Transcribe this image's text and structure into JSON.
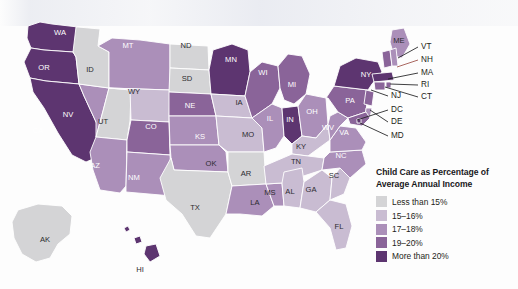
{
  "figure": {
    "width": 518,
    "height": 289,
    "background_color": "#fdfdfd"
  },
  "legend": {
    "title_line1": "Child Care as Percentage of",
    "title_line2": "Average Annual Income",
    "items": [
      {
        "label": "Less than 15%",
        "color": "#d4d4d6",
        "class_index": 0
      },
      {
        "label": "15–16%",
        "color": "#c9bcd2",
        "class_index": 1
      },
      {
        "label": "17–18%",
        "color": "#ab8fb9",
        "class_index": 2
      },
      {
        "label": "19–20%",
        "color": "#8a6499",
        "class_index": 3
      },
      {
        "label": "More than 20%",
        "color": "#5d3570",
        "class_index": 4
      }
    ]
  },
  "chart_data": {
    "type": "choropleth",
    "title": "Child Care as Percentage of Average Annual Income",
    "region": "United States",
    "classes": [
      "Less than 15%",
      "15–16%",
      "17–18%",
      "19–20%",
      "More than 20%"
    ],
    "class_colors": [
      "#d4d4d6",
      "#c9bcd2",
      "#ab8fb9",
      "#8a6499",
      "#5d3570"
    ],
    "legend_position": "bottom-right",
    "values": {
      "WA": 4,
      "OR": 4,
      "CA": 4,
      "NV": 2,
      "ID": 0,
      "UT": 0,
      "AZ": 2,
      "MT": 2,
      "WY": 1,
      "CO": 3,
      "NM": 2,
      "ND": 0,
      "SD": 0,
      "NE": 3,
      "KS": 2,
      "OK": 2,
      "TX": 0,
      "MN": 4,
      "IA": 1,
      "MO": 1,
      "AR": 0,
      "LA": 2,
      "WI": 3,
      "IL": 2,
      "MS": 2,
      "MI": 3,
      "IN": 4,
      "OH": 2,
      "KY": 1,
      "TN": 1,
      "AL": 1,
      "GA": 1,
      "FL": 1,
      "SC": 1,
      "NC": 2,
      "VA": 2,
      "WV": 2,
      "PA": 3,
      "NY": 4,
      "ME": 2,
      "VT": 3,
      "NH": 2,
      "MA": 4,
      "RI": 3,
      "CT": 3,
      "NJ": 3,
      "DE": 2,
      "MD": 3,
      "DC": 4,
      "AK": 0,
      "HI": 4
    },
    "state_labels": [
      {
        "code": "WA",
        "x": 60,
        "y": 33,
        "tone": "light"
      },
      {
        "code": "OR",
        "x": 44,
        "y": 68,
        "tone": "light"
      },
      {
        "code": "CA",
        "x": 38,
        "y": 131,
        "tone": "light"
      },
      {
        "code": "NV",
        "x": 68,
        "y": 115,
        "tone": "light"
      },
      {
        "code": "ID",
        "x": 90,
        "y": 70,
        "tone": "dark"
      },
      {
        "code": "UT",
        "x": 103,
        "y": 122,
        "tone": "dark"
      },
      {
        "code": "AZ",
        "x": 95,
        "y": 166,
        "tone": "light"
      },
      {
        "code": "MT",
        "x": 128,
        "y": 46,
        "tone": "light"
      },
      {
        "code": "WY",
        "x": 134,
        "y": 92,
        "tone": "dark"
      },
      {
        "code": "CO",
        "x": 151,
        "y": 127,
        "tone": "light"
      },
      {
        "code": "NM",
        "x": 134,
        "y": 178,
        "tone": "light"
      },
      {
        "code": "ND",
        "x": 186,
        "y": 46,
        "tone": "dark"
      },
      {
        "code": "SD",
        "x": 187,
        "y": 79,
        "tone": "dark"
      },
      {
        "code": "NE",
        "x": 190,
        "y": 106,
        "tone": "light"
      },
      {
        "code": "KS",
        "x": 200,
        "y": 137,
        "tone": "light"
      },
      {
        "code": "OK",
        "x": 211,
        "y": 164,
        "tone": "dark"
      },
      {
        "code": "TX",
        "x": 195,
        "y": 208,
        "tone": "dark"
      },
      {
        "code": "MN",
        "x": 231,
        "y": 60,
        "tone": "light"
      },
      {
        "code": "IA",
        "x": 239,
        "y": 103,
        "tone": "dark"
      },
      {
        "code": "MO",
        "x": 248,
        "y": 135,
        "tone": "dark"
      },
      {
        "code": "AR",
        "x": 246,
        "y": 174,
        "tone": "dark"
      },
      {
        "code": "LA",
        "x": 255,
        "y": 203,
        "tone": "dark"
      },
      {
        "code": "WI",
        "x": 263,
        "y": 73,
        "tone": "light"
      },
      {
        "code": "IL",
        "x": 270,
        "y": 119,
        "tone": "light"
      },
      {
        "code": "MS",
        "x": 270,
        "y": 193,
        "tone": "dark"
      },
      {
        "code": "MI",
        "x": 292,
        "y": 85,
        "tone": "light"
      },
      {
        "code": "IN",
        "x": 290,
        "y": 120,
        "tone": "light"
      },
      {
        "code": "OH",
        "x": 312,
        "y": 112,
        "tone": "light"
      },
      {
        "code": "KY",
        "x": 301,
        "y": 147,
        "tone": "dark"
      },
      {
        "code": "TN",
        "x": 296,
        "y": 162,
        "tone": "dark"
      },
      {
        "code": "AL",
        "x": 290,
        "y": 192,
        "tone": "dark"
      },
      {
        "code": "GA",
        "x": 311,
        "y": 190,
        "tone": "dark"
      },
      {
        "code": "FL",
        "x": 339,
        "y": 227,
        "tone": "dark"
      },
      {
        "code": "SC",
        "x": 334,
        "y": 176,
        "tone": "dark"
      },
      {
        "code": "NC",
        "x": 341,
        "y": 156,
        "tone": "light"
      },
      {
        "code": "VA",
        "x": 344,
        "y": 133,
        "tone": "light"
      },
      {
        "code": "WV",
        "x": 328,
        "y": 128,
        "tone": "light"
      },
      {
        "code": "PA",
        "x": 350,
        "y": 101,
        "tone": "light"
      },
      {
        "code": "NY",
        "x": 366,
        "y": 75,
        "tone": "light"
      },
      {
        "code": "ME",
        "x": 399,
        "y": 41,
        "tone": "dark"
      },
      {
        "code": "AK",
        "x": 45,
        "y": 240,
        "tone": "dark"
      },
      {
        "code": "HI",
        "x": 140,
        "y": 270,
        "tone": "dark"
      }
    ],
    "callouts": [
      {
        "code": "VT",
        "label_x": 421,
        "label_y": 47,
        "line": "M418,47 L398,58",
        "accent": false
      },
      {
        "code": "NH",
        "label_x": 421,
        "label_y": 60,
        "line": "M418,60 L397,67",
        "accent": true
      },
      {
        "code": "MA",
        "label_x": 421,
        "label_y": 73,
        "line": "M418,73 L388,79",
        "accent": false
      },
      {
        "code": "RI",
        "label_x": 421,
        "label_y": 85,
        "line": "M418,85 L390,84",
        "accent": false
      },
      {
        "code": "CT",
        "label_x": 421,
        "label_y": 97,
        "line": "M418,97 L385,87",
        "accent": false
      },
      {
        "code": "NJ",
        "label_x": 391,
        "label_y": 96,
        "line": "M388,96 L371,90",
        "accent": false
      },
      {
        "code": "DC",
        "label_x": 391,
        "label_y": 110,
        "line": "M388,110 L357,120",
        "accent": false
      },
      {
        "code": "DE",
        "label_x": 391,
        "label_y": 122,
        "line": "M388,122 L370,110",
        "accent": false
      },
      {
        "code": "MD",
        "label_x": 391,
        "label_y": 136,
        "line": "M388,136 L360,123",
        "accent": false
      }
    ]
  }
}
